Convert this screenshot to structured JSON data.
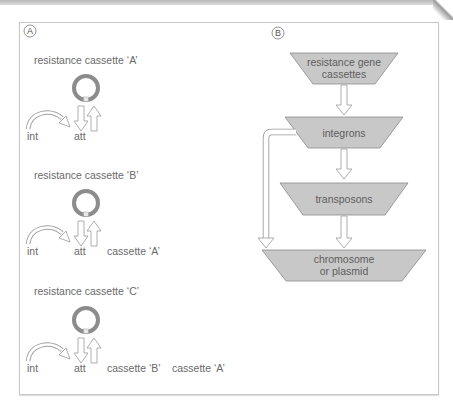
{
  "panel_a": {
    "badge": "A",
    "steps": [
      {
        "title": "resistance cassette ‘A’",
        "int_label": "int",
        "att_label": "att",
        "cassettes": []
      },
      {
        "title": "resistance cassette ‘B’",
        "int_label": "int",
        "att_label": "att",
        "cassettes": [
          "cassette ‘A’"
        ]
      },
      {
        "title": "resistance cassette ‘C’",
        "int_label": "int",
        "att_label": "att",
        "cassettes": [
          "cassette ‘B’",
          "cassette ‘A’"
        ]
      }
    ]
  },
  "panel_b": {
    "badge": "B",
    "nodes": [
      {
        "line1": "resistance gene",
        "line2": "cassettes"
      },
      {
        "line1": "integrons"
      },
      {
        "line1": "transposons"
      },
      {
        "line1": "chromosome",
        "line2": "or plasmid"
      }
    ]
  },
  "colors": {
    "node_fill": "#c8c8c8",
    "node_stroke": "#8a8a8a",
    "ring": "#8c8c8c",
    "arrow_stroke": "#9a9a9a",
    "baseline": "#555555"
  }
}
